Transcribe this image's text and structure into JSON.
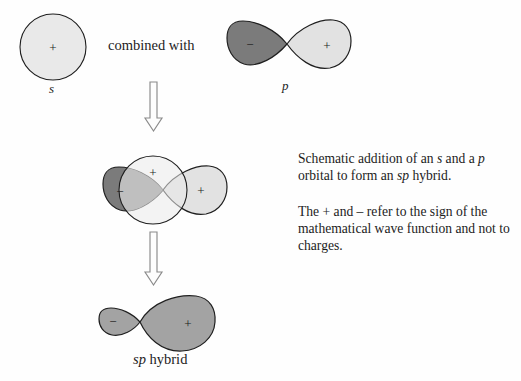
{
  "figure": {
    "type": "diagram",
    "background_color": "#fefefe",
    "colors": {
      "s_orbital_fill": "#e9e9e9",
      "p_negative_lobe_fill": "#7b7b7b",
      "p_positive_lobe_fill": "#e2e2e2",
      "hybrid_fill": "#a3a3a3",
      "overlap_dark_fill": "#8d8d8d",
      "outline": "#1f1f1f",
      "arrow_outline": "#7e7e7e"
    }
  },
  "labels": {
    "combined_with": "combined with",
    "s_orbital": "s",
    "p_orbital": "p",
    "sp_hybrid_italic": "sp",
    "sp_hybrid_rest": " hybrid"
  },
  "signs": {
    "s_plus": "+",
    "p_minus": "−",
    "p_plus": "+",
    "mid_s_plus": "+",
    "mid_minus": "−",
    "mid_plus": "+",
    "hybrid_minus": "−",
    "hybrid_plus": "+"
  },
  "caption": {
    "paragraph_1": {
      "part_1": "Schematic addition of an ",
      "italic_1": "s",
      "part_2": " and a ",
      "italic_2": "p",
      "part_3": " orbital to form an ",
      "italic_3": "sp",
      "part_4": " hybrid."
    },
    "paragraph_2": "The + and – refer to the sign of the mathematical wave function and not to charges."
  },
  "arrows": {
    "arrow_1_name": "down-arrow-top",
    "arrow_2_name": "down-arrow-bottom",
    "direction": "down"
  }
}
